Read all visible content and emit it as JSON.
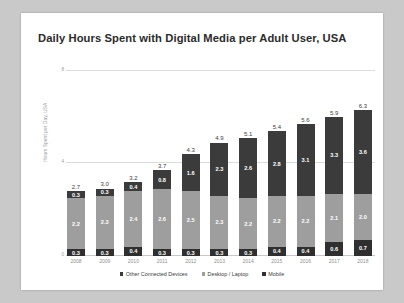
{
  "chart_data": {
    "type": "bar",
    "subtype": "stacked-bar",
    "title": "Daily Hours Spent with Digital Media per Adult User, USA",
    "xlabel": "",
    "ylabel": "Hours Spent per Day, USA",
    "ylim": [
      0,
      8
    ],
    "yticks": [
      "0",
      "4",
      "8"
    ],
    "ytick_values": [
      0,
      4,
      8
    ],
    "grid": true,
    "legend_position": "bottom",
    "categories": [
      "2008",
      "2009",
      "2010",
      "2011",
      "2012",
      "2013",
      "2014",
      "2015",
      "2016",
      "2017",
      "2018"
    ],
    "series": [
      {
        "name": "Other Connected Devices",
        "color": "#3b3b3b",
        "values": [
          0.3,
          0.3,
          0.4,
          0.8,
          1.6,
          2.3,
          2.6,
          2.8,
          3.1,
          3.3,
          3.6
        ]
      },
      {
        "name": "Desktop / Laptop",
        "color": "#9e9e9e",
        "values": [
          2.2,
          2.3,
          2.4,
          2.6,
          2.5,
          2.3,
          2.2,
          2.2,
          2.2,
          2.1,
          2.0
        ]
      },
      {
        "name": "Mobile",
        "color": "#2f2f2f",
        "values": [
          0.3,
          0.3,
          0.4,
          0.3,
          0.3,
          0.3,
          0.3,
          0.4,
          0.4,
          0.6,
          0.7
        ]
      }
    ],
    "totals": [
      2.7,
      3.0,
      3.2,
      3.7,
      4.3,
      4.9,
      5.1,
      5.4,
      5.6,
      5.9,
      6.3
    ],
    "total_labels": [
      "2.7",
      "3.0",
      "3.2",
      "3.7",
      "4.3",
      "4.9",
      "5.1",
      "5.4",
      "5.6",
      "5.9",
      "6.3"
    ],
    "segment_labels": {
      "other": [
        "0.3",
        "0.3",
        "0.4",
        "0.8",
        "1.6",
        "2.3",
        "2.6",
        "2.8",
        "3.1",
        "3.3",
        "3.6"
      ],
      "desktop": [
        "2.2",
        "2.3",
        "2.4",
        "2.6",
        "2.5",
        "2.3",
        "2.2",
        "2.2",
        "2.2",
        "2.1",
        "2.0"
      ],
      "mobile": [
        "0.3",
        "0.3",
        "0.4",
        "0.3",
        "0.3",
        "0.3",
        "0.3",
        "0.4",
        "0.4",
        "0.6",
        "0.7"
      ]
    }
  },
  "legend": {
    "items": [
      {
        "label": "Other Connected Devices",
        "color": "#3b3b3b"
      },
      {
        "label": "Desktop / Laptop",
        "color": "#9e9e9e"
      },
      {
        "label": "Mobile",
        "color": "#2f2f2f"
      }
    ]
  },
  "colors": {
    "slide_background": "#ffffff",
    "page_background": "#c9c9c9",
    "title_text": "#2b2b2b",
    "axis_text": "#9a9a9a",
    "gridline": "#dcdcdc"
  }
}
